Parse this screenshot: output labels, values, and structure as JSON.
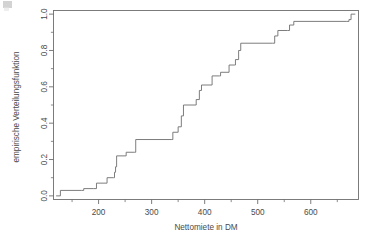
{
  "chart_data": {
    "type": "line",
    "subtype": "step-ecdf",
    "title": "",
    "xlabel": "Nettomiete in DM",
    "ylabel": "empirische Verteilungsfunktion",
    "xlim": [
      115,
      690
    ],
    "ylim": [
      -0.02,
      1.02
    ],
    "xticks": [
      200,
      300,
      400,
      500,
      600
    ],
    "xtick_labels": [
      "200",
      "300",
      "400",
      "500",
      "600"
    ],
    "yticks": [
      0.0,
      0.2,
      0.4,
      0.6,
      0.8,
      1.0
    ],
    "ytick_labels": [
      "0.0",
      "0.2",
      "0.4",
      "0.6",
      "0.8",
      "1.0"
    ],
    "yticks_minor": [
      0.1,
      0.3,
      0.5,
      0.7,
      0.9
    ],
    "xticks_minor": [
      150,
      250,
      350,
      450,
      550,
      650
    ],
    "grid": false,
    "legend": false,
    "line_color": "#6e6e6e",
    "line_width": 0.9,
    "frame_color": "#6e6e6e",
    "background": "#ffffff",
    "x": [
      120,
      128,
      168,
      172,
      188,
      196,
      212,
      222,
      228,
      232,
      238,
      248,
      252,
      268,
      274,
      338,
      344,
      348,
      352,
      366,
      372,
      382,
      392,
      404,
      418,
      428,
      438,
      448,
      462,
      466,
      528,
      534,
      540,
      556,
      562,
      668,
      674,
      682
    ],
    "y": [
      0.0,
      0.03,
      0.03,
      0.04,
      0.04,
      0.07,
      0.07,
      0.1,
      0.1,
      0.13,
      0.16,
      0.22,
      0.24,
      0.27,
      0.31,
      0.31,
      0.35,
      0.35,
      0.38,
      0.5,
      0.5,
      0.53,
      0.6,
      0.61,
      0.66,
      0.68,
      0.68,
      0.72,
      0.72,
      0.75,
      0.84,
      0.84,
      0.88,
      0.91,
      0.94,
      0.96,
      0.97,
      1.0
    ],
    "steps": [
      {
        "x": 120,
        "y": 0.0
      },
      {
        "x": 128,
        "y": 0.03
      },
      {
        "x": 168,
        "y": 0.03
      },
      {
        "x": 172,
        "y": 0.04
      },
      {
        "x": 190,
        "y": 0.04
      },
      {
        "x": 196,
        "y": 0.07
      },
      {
        "x": 212,
        "y": 0.07
      },
      {
        "x": 216,
        "y": 0.1
      },
      {
        "x": 228,
        "y": 0.1
      },
      {
        "x": 230,
        "y": 0.13
      },
      {
        "x": 232,
        "y": 0.16
      },
      {
        "x": 234,
        "y": 0.22
      },
      {
        "x": 250,
        "y": 0.22
      },
      {
        "x": 252,
        "y": 0.24
      },
      {
        "x": 268,
        "y": 0.24
      },
      {
        "x": 270,
        "y": 0.31
      },
      {
        "x": 338,
        "y": 0.31
      },
      {
        "x": 340,
        "y": 0.35
      },
      {
        "x": 348,
        "y": 0.35
      },
      {
        "x": 350,
        "y": 0.38
      },
      {
        "x": 356,
        "y": 0.44
      },
      {
        "x": 360,
        "y": 0.5
      },
      {
        "x": 382,
        "y": 0.5
      },
      {
        "x": 384,
        "y": 0.53
      },
      {
        "x": 390,
        "y": 0.58
      },
      {
        "x": 394,
        "y": 0.61
      },
      {
        "x": 412,
        "y": 0.61
      },
      {
        "x": 414,
        "y": 0.66
      },
      {
        "x": 428,
        "y": 0.66
      },
      {
        "x": 430,
        "y": 0.68
      },
      {
        "x": 444,
        "y": 0.68
      },
      {
        "x": 446,
        "y": 0.72
      },
      {
        "x": 456,
        "y": 0.72
      },
      {
        "x": 458,
        "y": 0.75
      },
      {
        "x": 464,
        "y": 0.8
      },
      {
        "x": 468,
        "y": 0.84
      },
      {
        "x": 528,
        "y": 0.84
      },
      {
        "x": 532,
        "y": 0.88
      },
      {
        "x": 538,
        "y": 0.91
      },
      {
        "x": 556,
        "y": 0.91
      },
      {
        "x": 560,
        "y": 0.94
      },
      {
        "x": 568,
        "y": 0.96
      },
      {
        "x": 668,
        "y": 0.96
      },
      {
        "x": 672,
        "y": 0.97
      },
      {
        "x": 676,
        "y": 1.0
      },
      {
        "x": 684,
        "y": 1.0
      }
    ]
  }
}
